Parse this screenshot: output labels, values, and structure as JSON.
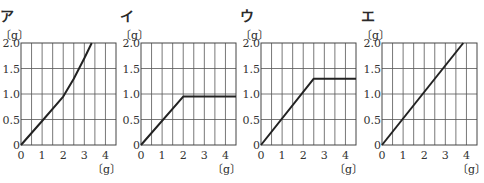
{
  "chart_data": [
    {
      "panel_label": "ア",
      "type": "line",
      "xlabel": "〔g〕",
      "ylabel": "〔g〕",
      "xlim": [
        0,
        4.5
      ],
      "ylim": [
        0,
        2.0
      ],
      "xticks": [
        "0",
        "1",
        "2",
        "3",
        "4"
      ],
      "yticks": [
        "0",
        "0.5",
        "1.0",
        "1.5",
        "2.0"
      ],
      "grid": true,
      "x": [
        0,
        1,
        2,
        2.5,
        3,
        3.35
      ],
      "y": [
        0,
        0.47,
        0.95,
        1.3,
        1.7,
        2.0
      ]
    },
    {
      "panel_label": "イ",
      "type": "line",
      "xlabel": "〔g〕",
      "ylabel": "〔g〕",
      "xlim": [
        0,
        4.5
      ],
      "ylim": [
        0,
        2.0
      ],
      "xticks": [
        "0",
        "1",
        "2",
        "3",
        "4"
      ],
      "yticks": [
        "0",
        "0.5",
        "1.0",
        "1.5",
        "2.0"
      ],
      "grid": true,
      "x": [
        0,
        2,
        4.5
      ],
      "y": [
        0,
        0.95,
        0.95
      ]
    },
    {
      "panel_label": "ウ",
      "type": "line",
      "xlabel": "〔g〕",
      "ylabel": "〔g〕",
      "xlim": [
        0,
        4.5
      ],
      "ylim": [
        0,
        2.0
      ],
      "xticks": [
        "0",
        "1",
        "2",
        "3",
        "4"
      ],
      "yticks": [
        "0",
        "0.5",
        "1.0",
        "1.5",
        "2.0"
      ],
      "grid": true,
      "x": [
        0,
        2.5,
        4.5
      ],
      "y": [
        0,
        1.3,
        1.3
      ]
    },
    {
      "panel_label": "エ",
      "type": "line",
      "xlabel": "〔g〕",
      "ylabel": "〔g〕",
      "xlim": [
        0,
        4.5
      ],
      "ylim": [
        0,
        2.0
      ],
      "xticks": [
        "0",
        "1",
        "2",
        "3",
        "4"
      ],
      "yticks": [
        "0",
        "0.5",
        "1.0",
        "1.5",
        "2.0"
      ],
      "grid": true,
      "x": [
        0,
        3.85
      ],
      "y": [
        0,
        2.0
      ]
    }
  ]
}
